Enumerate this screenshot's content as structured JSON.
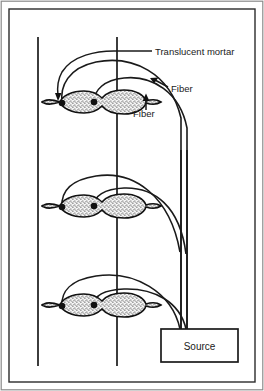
{
  "figure": {
    "border": {
      "outer_color": "#6b6b6b",
      "inner_color": "#2b2b2b"
    },
    "colors": {
      "line": "#1a1a1a",
      "stipple": "#2a2a2a",
      "mortar_fill": "#f2f2f2",
      "background": "#ffffff"
    },
    "labels": [
      {
        "id": "translucent-mortar",
        "text": "Translucent mortar",
        "x": 155,
        "y": 55
      },
      {
        "id": "fiber-upper",
        "text": "Fiber",
        "x": 171,
        "y": 92
      },
      {
        "id": "fiber-lower",
        "text": "Fiber",
        "x": 133,
        "y": 117
      }
    ],
    "source_box": {
      "label": "Source",
      "x": 161,
      "y": 329,
      "width": 77,
      "height": 33
    },
    "wall_lines": [
      {
        "id": "wall-line-left",
        "x": 38,
        "y1": 37,
        "y2": 366
      },
      {
        "id": "wall-line-right",
        "x": 117,
        "y1": 37,
        "y2": 366
      }
    ],
    "mortar_joints": [
      {
        "id": "mortar-joint-top",
        "cy": 102,
        "fiber_dots": [
          {
            "x": 62,
            "y": 103
          },
          {
            "x": 94,
            "y": 102
          }
        ]
      },
      {
        "id": "mortar-joint-middle",
        "cy": 206,
        "fiber_dots": [
          {
            "x": 62,
            "y": 207
          },
          {
            "x": 94,
            "y": 206
          }
        ]
      },
      {
        "id": "mortar-joint-bottom",
        "cy": 305,
        "fiber_dots": [
          {
            "x": 62,
            "y": 306
          },
          {
            "x": 94,
            "y": 305
          }
        ]
      }
    ],
    "fiber_bundle": {
      "trunk_x_left": 181,
      "trunk_x_right": 188,
      "enters_source_at_y": 329
    },
    "arrow_count": 2
  }
}
